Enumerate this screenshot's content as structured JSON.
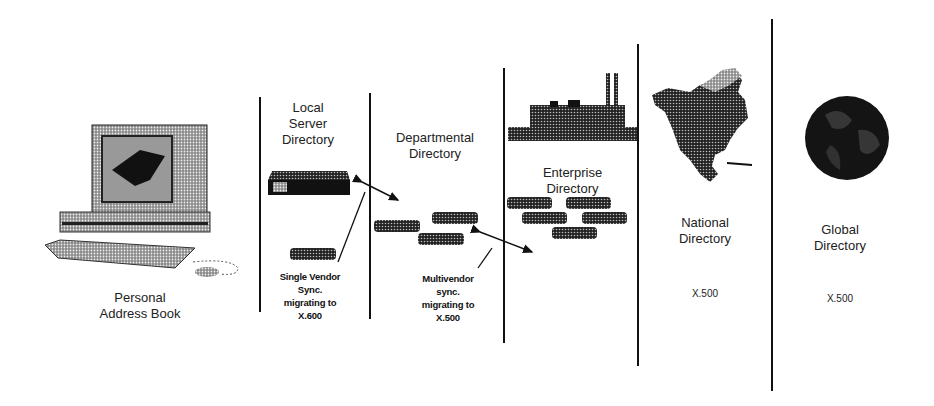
{
  "diagram": {
    "type": "directory-hierarchy",
    "columns": [
      {
        "id": "personal",
        "label_lines": [
          "Personal",
          "Address Book"
        ],
        "icon": "computer-icon"
      },
      {
        "id": "local",
        "label_lines": [
          "Local",
          "Server",
          "Directory"
        ],
        "icon": "server-icon",
        "note_lines": [
          "Single Vendor",
          "Sync.",
          "migrating to",
          "X.600"
        ]
      },
      {
        "id": "departmental",
        "label_lines": [
          "Departmental",
          "Directory"
        ],
        "icon": "workgroup-servers-icon",
        "note_lines": [
          "Multivendor",
          "sync.",
          "migrating to",
          "X.500"
        ]
      },
      {
        "id": "enterprise",
        "label_lines": [
          "Enterprise",
          "Directory"
        ],
        "icon": "factory-icon"
      },
      {
        "id": "national",
        "label_lines": [
          "National",
          "Directory"
        ],
        "icon": "north-america-map-icon",
        "standard": "X.500"
      },
      {
        "id": "global",
        "label_lines": [
          "Global",
          "Directory"
        ],
        "icon": "globe-icon",
        "standard": "X.500"
      }
    ],
    "colors": {
      "ink": "#111111",
      "halftone": "#555555",
      "background": "#ffffff"
    }
  }
}
